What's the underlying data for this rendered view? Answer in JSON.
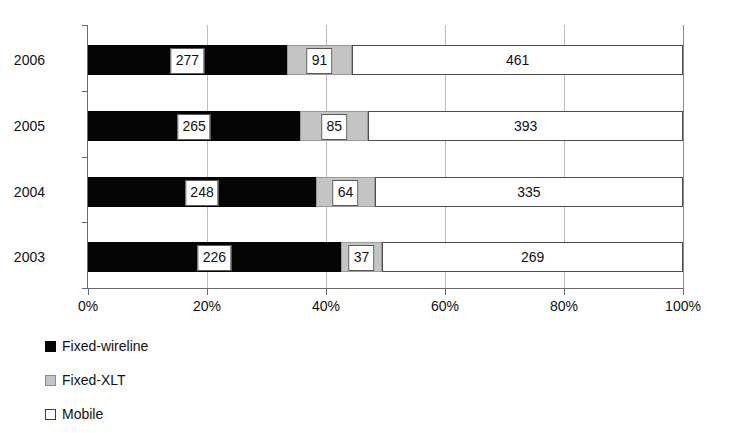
{
  "chart_data": {
    "type": "bar",
    "orientation": "horizontal",
    "stacked": true,
    "normalized": true,
    "title": "",
    "subtitle": "",
    "xlabel": "",
    "ylabel": "",
    "categories": [
      "2006",
      "2005",
      "2004",
      "2003"
    ],
    "series": [
      {
        "name": "Fixed-wireline",
        "color": "#050505",
        "values": [
          277,
          265,
          248,
          226
        ]
      },
      {
        "name": "Fixed-XLT",
        "color": "#c4c4c4",
        "values": [
          91,
          85,
          64,
          37
        ]
      },
      {
        "name": "Mobile",
        "color": "#ffffff",
        "values": [
          461,
          393,
          335,
          269
        ]
      }
    ],
    "xticks": [
      "0%",
      "20%",
      "40%",
      "60%",
      "80%",
      "100%"
    ],
    "xlim": [
      0,
      100
    ],
    "grid": "vertical",
    "legend_position": "bottom-left"
  },
  "axis": {
    "ticks": [
      {
        "label": "0%",
        "value": 0
      },
      {
        "label": "20%",
        "value": 20
      },
      {
        "label": "40%",
        "value": 40
      },
      {
        "label": "60%",
        "value": 60
      },
      {
        "label": "80%",
        "value": 80
      },
      {
        "label": "100%",
        "value": 100
      }
    ]
  },
  "rows": [
    {
      "year": "2006",
      "segments": [
        {
          "key": "wireline",
          "label": "277",
          "start": 0.0,
          "end": 33.414
        },
        {
          "key": "xlt",
          "label": "91",
          "start": 33.414,
          "end": 44.391
        },
        {
          "key": "mobile",
          "label": "461",
          "start": 44.391,
          "end": 100.0
        }
      ]
    },
    {
      "year": "2005",
      "segments": [
        {
          "key": "wireline",
          "label": "265",
          "start": 0.0,
          "end": 35.666
        },
        {
          "key": "xlt",
          "label": "85",
          "start": 35.666,
          "end": 47.106
        },
        {
          "key": "mobile",
          "label": "393",
          "start": 47.106,
          "end": 100.0
        }
      ]
    },
    {
      "year": "2004",
      "segments": [
        {
          "key": "wireline",
          "label": "248",
          "start": 0.0,
          "end": 38.331
        },
        {
          "key": "xlt",
          "label": "64",
          "start": 38.331,
          "end": 48.222
        },
        {
          "key": "mobile",
          "label": "335",
          "start": 48.222,
          "end": 100.0
        }
      ]
    },
    {
      "year": "2003",
      "segments": [
        {
          "key": "wireline",
          "label": "226",
          "start": 0.0,
          "end": 42.481
        },
        {
          "key": "xlt",
          "label": "37",
          "start": 42.481,
          "end": 49.436
        },
        {
          "key": "mobile",
          "label": "269",
          "start": 49.436,
          "end": 100.0
        }
      ]
    }
  ],
  "legend": {
    "items": [
      {
        "key": "wireline",
        "label": "Fixed-wireline",
        "swatch": "legend-swatch-black"
      },
      {
        "key": "xlt",
        "label": "Fixed-XLT",
        "swatch": "legend-swatch-gray"
      },
      {
        "key": "mobile",
        "label": "Mobile",
        "swatch": "legend-swatch-white"
      }
    ]
  },
  "colors": {
    "wireline": "#050505",
    "xlt": "#c4c4c4",
    "mobile": "#ffffff",
    "axis": "#6b6b6b",
    "grid": "#bdbdbd",
    "text": "#111111"
  }
}
